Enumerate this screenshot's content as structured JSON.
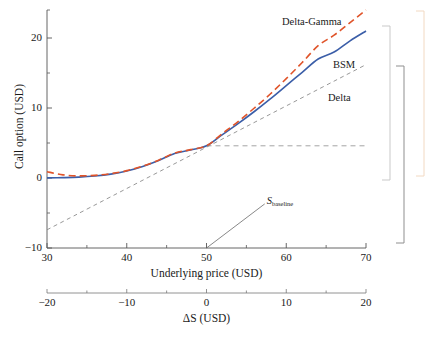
{
  "chart_data": {
    "type": "line",
    "title": "",
    "xlabel": "Underlying price (USD)",
    "ylabel": "Call option (USD)",
    "secondary_xlabel": "ΔS (USD)",
    "xlim": [
      30,
      70
    ],
    "ylim": [
      -10,
      24
    ],
    "secondary_xlim": [
      -20,
      20
    ],
    "xticks": [
      30,
      40,
      50,
      60,
      70
    ],
    "xtick_labels": [
      "30",
      "40",
      "50",
      "60",
      "70"
    ],
    "yticks": [
      -10,
      0,
      10,
      20
    ],
    "ytick_labels": [
      "-10",
      "0",
      "10",
      "20"
    ],
    "y_minor_ticks": [
      -5,
      5,
      15,
      24
    ],
    "x_minor_ticks": [
      35,
      45,
      55,
      65
    ],
    "secondary_xticks": [
      -20,
      -10,
      0,
      10,
      20
    ],
    "secondary_xtick_labels": [
      "−20",
      "−10",
      "0",
      "10",
      "20"
    ],
    "secondary_x_minor_ticks": [
      -15,
      -5,
      5,
      15
    ],
    "grid": false,
    "legend_position": "inline-labels",
    "baseline_price": 50,
    "baseline_value": 4.6,
    "series": [
      {
        "name": "BSM",
        "style": "solid",
        "color": "#3b5ea8",
        "label": "BSM",
        "x": [
          30,
          32,
          34,
          36,
          38,
          40,
          42,
          44,
          46,
          48,
          50,
          52,
          54,
          56,
          58,
          60,
          62,
          64,
          66,
          68,
          70
        ],
        "y": [
          0.02,
          0.05,
          0.12,
          0.28,
          0.55,
          1.0,
          1.65,
          2.5,
          3.5,
          4.0,
          4.6,
          6.2,
          7.8,
          9.5,
          11.3,
          13.2,
          15.1,
          17.0,
          18.0,
          19.6,
          21.0
        ]
      },
      {
        "name": "Delta-Gamma",
        "style": "dashed",
        "color": "#e0542a",
        "label": "Delta-Gamma",
        "x": [
          30,
          32,
          34,
          36,
          38,
          40,
          42,
          44,
          46,
          48,
          50,
          52,
          54,
          56,
          58,
          60,
          62,
          64,
          66,
          68,
          70
        ],
        "y": [
          0.9,
          0.45,
          0.3,
          0.38,
          0.62,
          1.05,
          1.7,
          2.55,
          3.55,
          4.05,
          4.6,
          6.35,
          8.1,
          10.0,
          12.0,
          14.2,
          16.5,
          18.9,
          20.4,
          22.2,
          24.0
        ]
      },
      {
        "name": "Delta",
        "style": "dashed",
        "color": "#8c8c8c",
        "label": "Delta",
        "x": [
          30,
          70
        ],
        "y": [
          -7.4,
          16.2
        ]
      }
    ],
    "annotations": [
      {
        "name": "baseline",
        "text_main": "S",
        "text_sub": "baseline",
        "x": 50,
        "y": -10,
        "label_x": 57.3,
        "label_y": -3.7
      }
    ],
    "reference_lines": [
      {
        "name": "baseline-horizontal",
        "orientation": "horizontal",
        "value": 4.6,
        "x_from": 50,
        "x_to": 70,
        "style": "dashed",
        "color": "#9a9a9a"
      }
    ],
    "brackets": [
      {
        "name": "bracket-gray",
        "color": "#c9c9c9",
        "x": 390,
        "y_top": 26,
        "y_bottom": 180,
        "arm": 8
      },
      {
        "name": "bracket-dark",
        "color": "#8f8f8f",
        "x": 404,
        "y_top": 66,
        "y_bottom": 243,
        "arm": 8
      },
      {
        "name": "bracket-orange",
        "color": "#f2d9c2",
        "x": 424,
        "y_top": 11,
        "y_bottom": 176,
        "arm": 8
      }
    ]
  },
  "footer": {
    "items": [
      "",
      "",
      ""
    ]
  }
}
